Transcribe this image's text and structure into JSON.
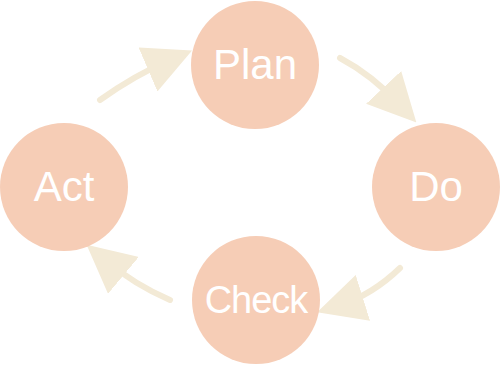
{
  "diagram": {
    "type": "cycle",
    "node_color": "#f6cdb6",
    "text_color": "#ffffff",
    "arrow_color": "#f3ead6",
    "nodes": [
      {
        "id": "plan",
        "label": "Plan",
        "cx": 255,
        "cy": 65,
        "r": 64
      },
      {
        "id": "do",
        "label": "Do",
        "cx": 436,
        "cy": 187,
        "r": 64
      },
      {
        "id": "check",
        "label": "Check",
        "cx": 256,
        "cy": 300,
        "r": 64
      },
      {
        "id": "act",
        "label": "Act",
        "cx": 64,
        "cy": 187,
        "r": 64
      }
    ],
    "edges": [
      {
        "from": "plan",
        "to": "do"
      },
      {
        "from": "do",
        "to": "check"
      },
      {
        "from": "check",
        "to": "act"
      },
      {
        "from": "act",
        "to": "plan"
      }
    ]
  }
}
